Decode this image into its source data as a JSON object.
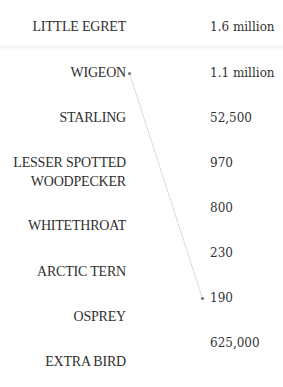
{
  "birds": [
    {
      "name": "LITTLE EGRET",
      "value": "1.6 million"
    },
    {
      "name": "WIGEON",
      "value": "1.1 million"
    },
    {
      "name": "STARLING",
      "value": "52,500"
    },
    {
      "name_line1": "LESSER SPOTTED",
      "name_line2": "WOODPECKER",
      "value": "970"
    },
    {
      "name": "WHITETHROAT",
      "value": "800"
    },
    {
      "name": "ARCTIC TERN",
      "value": "230"
    },
    {
      "name": "OSPREY",
      "value": "190"
    },
    {
      "name": "EXTRA BIRD",
      "value": "625,000"
    }
  ],
  "connector": {
    "from": "WIGEON",
    "to": "190",
    "color": "#999999",
    "style": "dotted"
  }
}
